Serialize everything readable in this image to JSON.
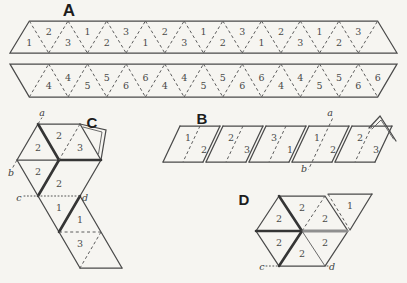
{
  "figure": "hexaflexagon-folding-diagram",
  "titles": {
    "A": "A",
    "B": "B",
    "C": "C",
    "D": "D"
  },
  "panels": {
    "A": {
      "title": "A",
      "strip1": {
        "numbers": [
          "1",
          "2",
          "3",
          "1",
          "2",
          "3",
          "1",
          "2",
          "3",
          "1",
          "2",
          "3",
          "1",
          "2",
          "3",
          "1",
          "2",
          "3"
        ]
      },
      "strip2": {
        "numbers": [
          "4",
          "4",
          "5",
          "5",
          "6",
          "6",
          "4",
          "4",
          "5",
          "5",
          "6",
          "6",
          "4",
          "4",
          "5",
          "5",
          "6",
          "6"
        ]
      }
    },
    "B": {
      "title": "B",
      "segments": [
        [
          "1",
          "2"
        ],
        [
          "2",
          "3"
        ],
        [
          "3",
          "1"
        ],
        [
          "1",
          "2"
        ],
        [
          "2",
          "3"
        ]
      ],
      "labels": {
        "a": "a",
        "b": "b"
      }
    },
    "C": {
      "title": "C",
      "numbers": [
        "2",
        "2",
        "3",
        "2",
        "2",
        "1",
        "1",
        "3"
      ],
      "labels": {
        "a": "a",
        "b": "b",
        "c": "c",
        "d": "d"
      }
    },
    "D": {
      "title": "D",
      "hexagon_numbers": [
        "2",
        "2",
        "2",
        "2",
        "2",
        "2"
      ],
      "flap_number": "1",
      "labels": {
        "c": "c",
        "d": "d"
      }
    }
  },
  "colors": {
    "background": "#f6f5f1",
    "line": "#4a4a4a",
    "dashed_fold": "#5c5c5c",
    "heavy_fold": "#353535",
    "heavy_fold_gray": "#8f8f8f",
    "number_text": "#4a4a4a",
    "title_text": "#1d1d1d"
  }
}
